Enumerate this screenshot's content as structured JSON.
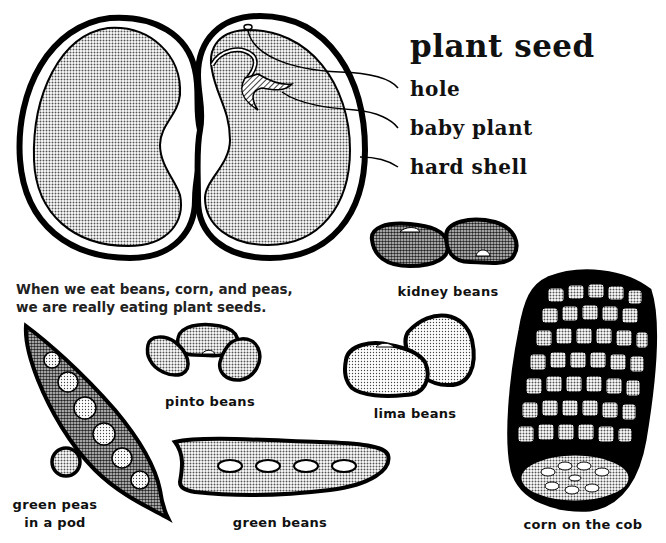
{
  "diagram": {
    "title": "plant seed",
    "callouts": [
      {
        "label": "hole"
      },
      {
        "label": "baby plant"
      },
      {
        "label": "hard shell"
      }
    ],
    "caption": {
      "line1": "When we eat beans, corn, and peas,",
      "line2": "we are really eating plant seeds."
    },
    "examples": {
      "kidney_beans": "kidney beans",
      "pinto_beans": "pinto beans",
      "lima_beans": "lima beans",
      "green_peas_line1": "green peas",
      "green_peas_line2": "in a pod",
      "green_beans": "green beans",
      "corn": "corn on the cob"
    },
    "colors": {
      "ink": "#000000",
      "fill_dark": "#6e6e6e",
      "fill_mid": "#a8a8a8",
      "fill_light": "#d0d0d0",
      "background": "#ffffff"
    }
  }
}
